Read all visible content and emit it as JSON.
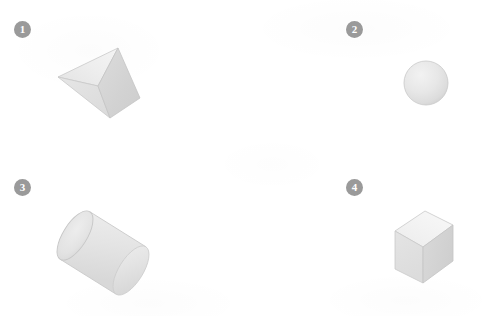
{
  "page": {
    "background_color": "#ffffff",
    "width": 495,
    "height": 316
  },
  "palette": {
    "badge_fill": "#9a9a9a",
    "badge_text": "#ffffff",
    "face_light": "#ebebeb",
    "face_mid": "#e0e0e0",
    "face_dark": "#d4d4d4",
    "outline": "#c8c8c8",
    "outline_soft": "#d8d8d8"
  },
  "panels": [
    {
      "number": "1",
      "badge_name": "badge-1",
      "shape": "triangular-prism",
      "shape_label": "Triangular prism"
    },
    {
      "number": "2",
      "badge_name": "badge-2",
      "shape": "sphere",
      "shape_label": "Sphere"
    },
    {
      "number": "3",
      "badge_name": "badge-3",
      "shape": "cylinder",
      "shape_label": "Cylinder"
    },
    {
      "number": "4",
      "badge_name": "badge-4",
      "shape": "cube",
      "shape_label": "Cube"
    }
  ]
}
